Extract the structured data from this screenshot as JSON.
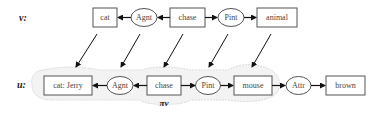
{
  "graph_v": {
    "label": "v:",
    "nodes": [
      {
        "id": "v_cat",
        "type": "concept",
        "text": "cat"
      },
      {
        "id": "v_agnt",
        "type": "relation",
        "text": "Agnt"
      },
      {
        "id": "v_chase",
        "type": "concept",
        "text": "chase"
      },
      {
        "id": "v_pint",
        "type": "relation",
        "text": "Pint"
      },
      {
        "id": "v_animal",
        "type": "concept",
        "text": "animal"
      }
    ]
  },
  "graph_u": {
    "label": "u:",
    "nodes": [
      {
        "id": "u_cat",
        "type": "concept",
        "text": "cat: Jerry"
      },
      {
        "id": "u_agnt",
        "type": "relation",
        "text": "Agnt"
      },
      {
        "id": "u_chase",
        "type": "concept",
        "text": "chase"
      },
      {
        "id": "u_pint",
        "type": "relation",
        "text": "Pint"
      },
      {
        "id": "u_mouse",
        "type": "concept",
        "text": "mouse"
      },
      {
        "id": "u_attr",
        "type": "relation",
        "text": "Attr"
      },
      {
        "id": "u_brown",
        "type": "concept",
        "text": "brown"
      }
    ]
  },
  "projection_label": "πv"
}
